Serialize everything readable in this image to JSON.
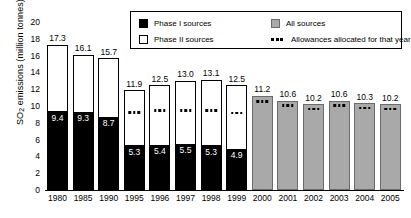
{
  "chart_data": {
    "type": "bar",
    "title": "",
    "xlabel": "",
    "ylabel": "SO2 emissions (million tonnes)",
    "ylabel_prefix": "SO",
    "ylabel_sub": "2",
    "ylabel_suffix": " emissions (million tonnes)",
    "ylim": [
      0,
      20
    ],
    "yticks": [
      20,
      18,
      16,
      14,
      12,
      10,
      8,
      6,
      4,
      2,
      0
    ],
    "grid": false,
    "legend_position": "top-right",
    "categories": [
      "1980",
      "1985",
      "1990",
      "1995",
      "1996",
      "1997",
      "1998",
      "1999",
      "2000",
      "2001",
      "2002",
      "2003",
      "2004",
      "2005"
    ],
    "series": [
      {
        "name": "Phase I sources",
        "values": [
          9.4,
          9.3,
          8.7,
          5.3,
          5.4,
          5.5,
          5.3,
          4.9,
          null,
          null,
          null,
          null,
          null,
          null
        ]
      },
      {
        "name": "Phase II sources",
        "note": "stacked remainder up to total",
        "values": [
          7.9,
          6.8,
          7.0,
          6.6,
          7.1,
          7.5,
          7.8,
          7.6,
          null,
          null,
          null,
          null,
          null,
          null
        ]
      },
      {
        "name": "All sources",
        "values": [
          null,
          null,
          null,
          null,
          null,
          null,
          null,
          null,
          11.2,
          10.6,
          10.2,
          10.6,
          10.3,
          10.2
        ]
      }
    ],
    "totals": [
      17.3,
      16.1,
      15.7,
      11.9,
      12.5,
      13.0,
      13.1,
      12.5,
      11.2,
      10.6,
      10.2,
      10.6,
      10.3,
      10.2
    ],
    "allowances_allocated": [
      null,
      null,
      null,
      9.1,
      9.3,
      9.3,
      9.3,
      9.0,
      10.4,
      9.9,
      9.5,
      9.9,
      9.6,
      9.5
    ],
    "bars": [
      {
        "year": "1980",
        "total": 17.3,
        "phase1": 9.4,
        "total_label": "17.3",
        "phase1_label": "9.4",
        "kind": "stacked",
        "allowance": null
      },
      {
        "year": "1985",
        "total": 16.1,
        "phase1": 9.3,
        "total_label": "16.1",
        "phase1_label": "9.3",
        "kind": "stacked",
        "allowance": null
      },
      {
        "year": "1990",
        "total": 15.7,
        "phase1": 8.7,
        "total_label": "15.7",
        "phase1_label": "8.7",
        "kind": "stacked",
        "allowance": null
      },
      {
        "year": "1995",
        "total": 11.9,
        "phase1": 5.3,
        "total_label": "11.9",
        "phase1_label": "5.3",
        "kind": "stacked",
        "allowance": 9.1
      },
      {
        "year": "1996",
        "total": 12.5,
        "phase1": 5.4,
        "total_label": "12.5",
        "phase1_label": "5.4",
        "kind": "stacked",
        "allowance": 9.3
      },
      {
        "year": "1997",
        "total": 13.0,
        "phase1": 5.5,
        "total_label": "13.0",
        "phase1_label": "5.5",
        "kind": "stacked",
        "allowance": 9.3
      },
      {
        "year": "1998",
        "total": 13.1,
        "phase1": 5.3,
        "total_label": "13.1",
        "phase1_label": "5.3",
        "kind": "stacked",
        "allowance": 9.3
      },
      {
        "year": "1999",
        "total": 12.5,
        "phase1": 4.9,
        "total_label": "12.5",
        "phase1_label": "4.9",
        "kind": "stacked",
        "allowance": 9.0
      },
      {
        "year": "2000",
        "total": 11.2,
        "phase1": null,
        "total_label": "11.2",
        "phase1_label": "",
        "kind": "all",
        "allowance": 10.4
      },
      {
        "year": "2001",
        "total": 10.6,
        "phase1": null,
        "total_label": "10.6",
        "phase1_label": "",
        "kind": "all",
        "allowance": 9.9
      },
      {
        "year": "2002",
        "total": 10.2,
        "phase1": null,
        "total_label": "10.2",
        "phase1_label": "",
        "kind": "all",
        "allowance": 9.5
      },
      {
        "year": "2003",
        "total": 10.6,
        "phase1": null,
        "total_label": "10.6",
        "phase1_label": "",
        "kind": "all",
        "allowance": 9.9
      },
      {
        "year": "2004",
        "total": 10.3,
        "phase1": null,
        "total_label": "10.3",
        "phase1_label": "",
        "kind": "all",
        "allowance": 9.6
      },
      {
        "year": "2005",
        "total": 10.2,
        "phase1": null,
        "total_label": "10.2",
        "phase1_label": "",
        "kind": "all",
        "allowance": 9.5
      }
    ],
    "legend": {
      "entries": [
        {
          "label": "Phase I sources",
          "swatch": "black"
        },
        {
          "label": "All sources",
          "swatch": "gray"
        },
        {
          "label": "Phase II sources",
          "swatch": "white"
        },
        {
          "label": "Allowances allocated for that year",
          "swatch": "dots"
        }
      ]
    },
    "colors": {
      "phase1": "#000000",
      "phase2": "#ffffff",
      "all": "#a9a9a9",
      "outline": "#000000",
      "dots": "#000000",
      "background": "#ffffff"
    }
  }
}
